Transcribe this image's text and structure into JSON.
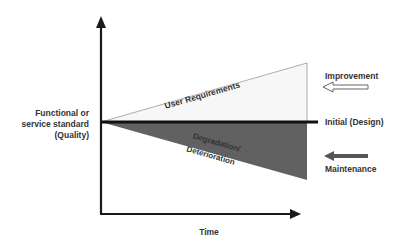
{
  "diagram": {
    "y_axis_label": [
      "Functional or",
      "service standard",
      "(Quality)"
    ],
    "x_axis_label": "Time",
    "upper_region_label": "User Requirements",
    "lower_region_label_line1": "Degradation/",
    "lower_region_label_line2": "Deterioration",
    "baseline_label": "Initial (Design)",
    "improvement_label": "Improvement",
    "maintenance_label": "Maintenance",
    "colors": {
      "upper_fill": "#f7f7f7",
      "upper_stroke": "#999999",
      "lower_fill": "#616161",
      "axis": "#1a1a1a",
      "baseline": "#111111",
      "text": "#333333",
      "maintenance_arrow": "#555555"
    }
  }
}
